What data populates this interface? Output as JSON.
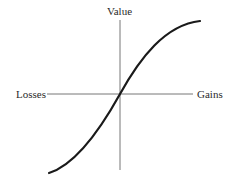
{
  "diagram": {
    "type": "value-function",
    "labels": {
      "y_axis": "Value",
      "x_negative": "Losses",
      "x_positive": "Gains"
    },
    "colors": {
      "axis": "#777777",
      "curve": "#1a1a1a",
      "text": "#2a2a2a",
      "background": "#ffffff"
    }
  }
}
